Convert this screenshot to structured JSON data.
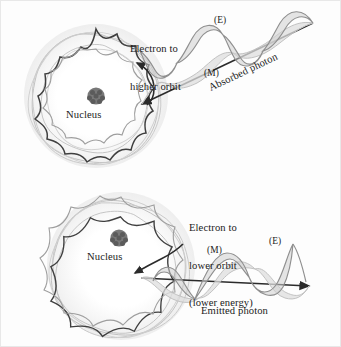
{
  "figure": {
    "background_color": "#fdfdfd",
    "border_color": "#e8e8e8"
  },
  "colors": {
    "orbit_dark": "#3a3a3a",
    "orbit_light": "#b9b9b9",
    "orbit_mid": "#9a9a9a",
    "nucleus": "#6e6e6e",
    "wave_E": "#8f8f8f",
    "wave_M": "#c2c2c2",
    "wave_fill": "#d6d6d6",
    "arrow": "#2b2b2b",
    "text": "#1b1b1b",
    "halo": "#f2f2f2"
  },
  "panels": [
    {
      "id": "absorption",
      "transition_label": "Electron to\nhigher orbit",
      "transition_lines": [
        "Electron to",
        "higher orbit"
      ],
      "nucleus_label": "Nucleus",
      "photon_label": "Absorbed photon",
      "photon_direction": "incoming",
      "wave_components": [
        {
          "name": "(E)",
          "meaning": "electric-field-component"
        },
        {
          "name": "(M)",
          "meaning": "magnetic-field-component"
        }
      ],
      "orbit_lobes_outer": 9,
      "orbit_lobes_inner": 9
    },
    {
      "id": "emission",
      "transition_label": "Electron to\nlower orbit\n(lower energy)",
      "transition_lines": [
        "Electron to",
        "lower orbit",
        "(lower energy)"
      ],
      "nucleus_label": "Nucleus",
      "photon_label": "Emitted photon",
      "photon_direction": "outgoing",
      "wave_components": [
        {
          "name": "(E)",
          "meaning": "electric-field-component"
        },
        {
          "name": "(M)",
          "meaning": "magnetic-field-component"
        }
      ],
      "orbit_lobes_outer": 9,
      "orbit_lobes_inner": 7
    }
  ],
  "labels": {
    "electron_to_higher_orbit_l1": "Electron to",
    "electron_to_higher_orbit_l2": "higher orbit",
    "electron_to_lower_orbit_l1": "Electron to",
    "electron_to_lower_orbit_l2": "lower orbit",
    "electron_to_lower_orbit_l3": "(lower energy)",
    "nucleus_top": "Nucleus",
    "nucleus_bottom": "Nucleus",
    "absorbed_photon": "Absorbed photon",
    "emitted_photon": "Emitted photon",
    "E_top": "(E)",
    "M_top": "(M)",
    "E_bottom": "(E)",
    "M_bottom": "(M)"
  }
}
